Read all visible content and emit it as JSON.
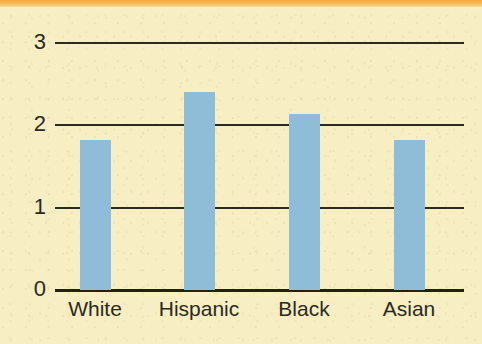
{
  "chart_data": {
    "type": "bar",
    "title": "",
    "subtitle": "",
    "xlabel": "",
    "ylabel": "",
    "categories": [
      "White",
      "Hispanic",
      "Black",
      "Asian"
    ],
    "values": [
      1.82,
      2.4,
      2.13,
      1.82
    ],
    "series": [
      {
        "name": "",
        "values": [
          1.82,
          2.4,
          2.13,
          1.82
        ]
      }
    ],
    "ylim": [
      0,
      3
    ],
    "yticks": [
      0,
      1,
      2,
      3
    ],
    "ytick_labels": [
      "0",
      "1",
      "2",
      "3"
    ],
    "xtick_labels": [
      "White",
      "Hispanic",
      "Black",
      "Asian"
    ],
    "grid": true,
    "grid_axis": "y",
    "legend": false,
    "legend_position": "none",
    "annotations": []
  },
  "axes": {
    "y": {
      "ticks": [
        {
          "label": "3",
          "value": 3
        },
        {
          "label": "2",
          "value": 2
        },
        {
          "label": "1",
          "value": 1
        },
        {
          "label": "0",
          "value": 0
        }
      ]
    },
    "x": {
      "ticks": [
        {
          "label": "White"
        },
        {
          "label": "Hispanic"
        },
        {
          "label": "Black"
        },
        {
          "label": "Asian"
        }
      ]
    }
  },
  "bars": [
    {
      "category": "White",
      "value": 1.82
    },
    {
      "category": "Hispanic",
      "value": 2.4
    },
    {
      "category": "Black",
      "value": 2.13
    },
    {
      "category": "Asian",
      "value": 1.82
    }
  ],
  "colors": {
    "background": "#f7eec3",
    "top_band": "#f2a73a",
    "bar": "#8fbdd8",
    "axis": "#211f19",
    "gridline": "#2b2a22",
    "text": "#2b2a22"
  }
}
